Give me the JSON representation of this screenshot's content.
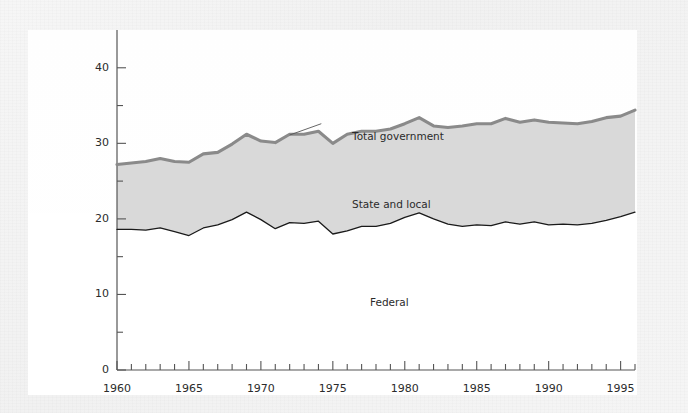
{
  "figure": {
    "background_color": "#f4f4f4",
    "panel_color": "#ffffff",
    "fill_color": "#d9d9d9",
    "total_line_color": "#8a8a8a",
    "federal_line_color": "#1a1a1a"
  },
  "axis": {
    "y_title": "Revenue as\nPercent of\nGDP",
    "y_ticks_major": [
      "0",
      "10",
      "20",
      "30",
      "40"
    ],
    "y_ticks_minor": [
      5,
      15,
      25,
      35
    ],
    "x_ticks_major": [
      "1960",
      "1965",
      "1970",
      "1975",
      "1980",
      "1985",
      "1990",
      "1995"
    ]
  },
  "annotations": {
    "total_government": "Total government",
    "state_and_local": "State and local",
    "federal": "Federal"
  },
  "chart_data": {
    "type": "area",
    "title": "",
    "xlabel": "",
    "ylabel": "Revenue as Percent of GDP",
    "xlim": [
      1960,
      1996
    ],
    "ylim": [
      0,
      45
    ],
    "grid": false,
    "legend": "in-plot annotations",
    "x": [
      1960,
      1961,
      1962,
      1963,
      1964,
      1965,
      1966,
      1967,
      1968,
      1969,
      1970,
      1971,
      1972,
      1973,
      1974,
      1975,
      1976,
      1977,
      1978,
      1979,
      1980,
      1981,
      1982,
      1983,
      1984,
      1985,
      1986,
      1987,
      1988,
      1989,
      1990,
      1991,
      1992,
      1993,
      1994,
      1995,
      1996
    ],
    "series": [
      {
        "name": "Total government",
        "style": "thick gray line, upper boundary of shaded band",
        "values": [
          27.2,
          27.4,
          27.6,
          28.0,
          27.6,
          27.5,
          28.6,
          28.8,
          29.9,
          31.2,
          30.3,
          30.1,
          31.2,
          31.2,
          31.6,
          30.0,
          31.2,
          31.6,
          31.6,
          31.9,
          32.6,
          33.4,
          32.3,
          32.1,
          32.3,
          32.6,
          32.6,
          33.3,
          32.8,
          33.1,
          32.8,
          32.7,
          32.6,
          32.9,
          33.4,
          33.6,
          34.4
        ]
      },
      {
        "name": "Federal",
        "style": "thin black line, lower boundary of shaded band",
        "values": [
          18.6,
          18.6,
          18.5,
          18.8,
          18.3,
          17.8,
          18.8,
          19.2,
          19.9,
          20.9,
          19.9,
          18.7,
          19.5,
          19.4,
          19.7,
          18.0,
          18.4,
          19.0,
          19.0,
          19.4,
          20.2,
          20.8,
          20.0,
          19.3,
          19.0,
          19.2,
          19.1,
          19.6,
          19.3,
          19.6,
          19.2,
          19.3,
          19.2,
          19.4,
          19.8,
          20.3,
          20.9
        ]
      }
    ],
    "derived_band": {
      "name": "State and local",
      "description": "Area between Federal line and Total government line"
    }
  }
}
